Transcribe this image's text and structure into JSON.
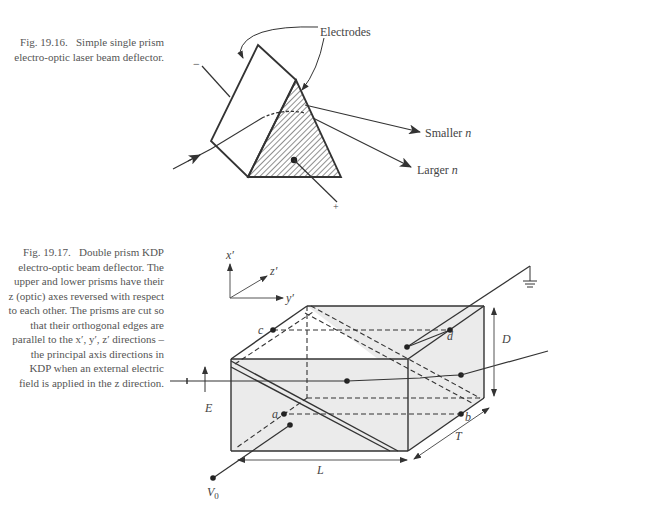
{
  "figures": [
    {
      "id": "fig-19-16",
      "caption": {
        "number": "Fig. 19.16.",
        "text": "Simple single prism electro-optic laser beam deflector."
      },
      "labels": {
        "electrodes": "Electrodes",
        "smaller_n": "Smaller ",
        "smaller_n_var": "n",
        "larger_n": "Larger ",
        "larger_n_var": "n",
        "minus": "−",
        "plus": "+"
      }
    },
    {
      "id": "fig-19-17",
      "caption": {
        "number": "Fig. 19.17.",
        "text": "Double prism KDP electro-optic beam deflector. The upper and lower prisms have their z (optic) axes reversed with respect to each other. The prisms are cut so that their orthogonal edges are parallel to the x′, y′, z′ directions – the principal axis directions in KDP when an external electric field is applied in the z direction."
      },
      "labels": {
        "axis_x": "x′",
        "axis_y": "y′",
        "axis_z": "z′",
        "point_a": "a",
        "point_b": "b",
        "point_c": "c",
        "point_d": "d",
        "dim_D": "D",
        "dim_L": "L",
        "dim_T": "T",
        "field_E": "E",
        "voltage": "V",
        "voltage_sub": "0"
      }
    }
  ],
  "colors": {
    "line": "#333333",
    "fill_box": "#ebebeb",
    "text": "#444444"
  }
}
